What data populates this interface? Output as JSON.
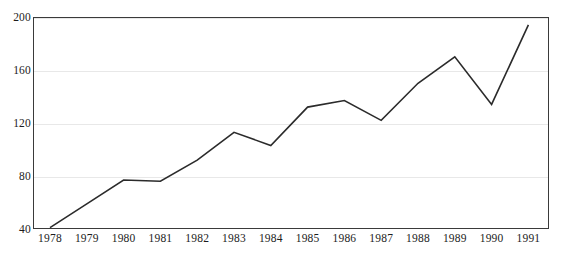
{
  "chart_data": {
    "type": "line",
    "title": "",
    "subtitle": "",
    "xlabel": "",
    "ylabel": "",
    "categories": [
      "1978",
      "1979",
      "1980",
      "1981",
      "1982",
      "1983",
      "1984",
      "1985",
      "1986",
      "1987",
      "1988",
      "1989",
      "1990",
      "1991"
    ],
    "series": [
      {
        "name": "series-1",
        "values": [
          41,
          59,
          77,
          76,
          92,
          113,
          103,
          132,
          137,
          122,
          150,
          170,
          134,
          194
        ],
        "color": "#2b2b2b",
        "line_width": 1.6,
        "markers": false
      }
    ],
    "ylim": [
      40,
      200
    ],
    "yticks": [
      40,
      80,
      120,
      160,
      200
    ],
    "ytick_labels": [
      "40",
      "80",
      "120",
      "160",
      "200"
    ],
    "xtick_labels": [
      "1978",
      "1979",
      "1980",
      "1981",
      "1982",
      "1983",
      "1984",
      "1985",
      "1986",
      "1987",
      "1988",
      "1989",
      "1990",
      "1991"
    ],
    "grid": true,
    "grid_axis": "y",
    "grid_color": "#e8e8e8",
    "legend": false,
    "legend_position": "none",
    "frame_color": "#3a3a3a",
    "background_color": "#ffffff",
    "annotations": []
  },
  "axes": {
    "y_tick_0": "40",
    "y_tick_1": "80",
    "y_tick_2": "120",
    "y_tick_3": "160",
    "y_tick_4": "200"
  }
}
